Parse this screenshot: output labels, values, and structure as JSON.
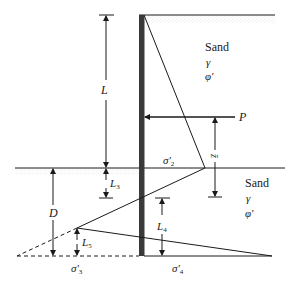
{
  "diagram": {
    "type": "cantilever-sheet-pile-pressure-distribution",
    "colors": {
      "line": "#1a1a1a",
      "pile": "#3a3a3a",
      "soil_stipple": "#bdbdbd"
    },
    "upper_soil": {
      "name": "Sand",
      "unit_weight": "γ",
      "friction_angle": "φ′"
    },
    "lower_soil": {
      "name": "Sand",
      "unit_weight": "γ",
      "friction_angle": "φ′"
    },
    "labels": {
      "L": "L",
      "P": "P",
      "z_bar": "z̄",
      "sigma2": "σ′",
      "sigma2_sub": "2",
      "L3": "L",
      "L3_sub": "3",
      "D": "D",
      "L4": "L",
      "L4_sub": "4",
      "L5": "L",
      "L5_sub": "5",
      "sigma3": "σ′",
      "sigma3_sub": "3",
      "sigma4": "σ′",
      "sigma4_sub": "4"
    }
  }
}
